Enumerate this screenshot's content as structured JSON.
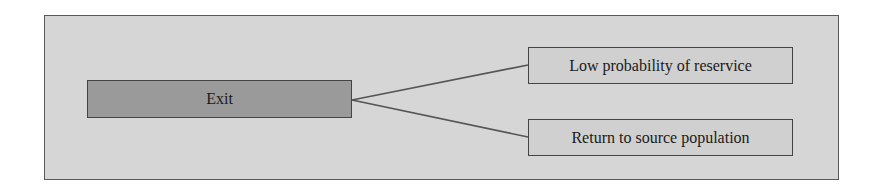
{
  "diagram": {
    "type": "flow-branch",
    "colors": {
      "panel_background": "#d6d6d6",
      "panel_border": "#5a5a5a",
      "source_node_fill": "#9a9a9a",
      "target_node_fill": "#d0d0d0",
      "connector": "#555555",
      "text": "#1a1a1a"
    },
    "source": {
      "label": "Exit"
    },
    "targets": [
      {
        "label": "Low probability of reservice"
      },
      {
        "label": "Return to source population"
      }
    ],
    "edges": [
      {
        "from": "Exit",
        "to": "Low probability of reservice"
      },
      {
        "from": "Exit",
        "to": "Return to source population"
      }
    ]
  }
}
